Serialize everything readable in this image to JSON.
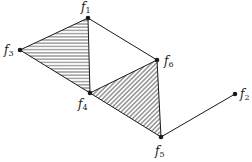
{
  "diagram": {
    "title": "",
    "nodes": [
      {
        "id": "f1",
        "label": "f",
        "sub": "1",
        "x": 88,
        "y": 18,
        "lx": 81,
        "ly": 11
      },
      {
        "id": "f2",
        "label": "f",
        "sub": "2",
        "x": 235,
        "y": 94,
        "lx": 240,
        "ly": 98
      },
      {
        "id": "f3",
        "label": "f",
        "sub": "3",
        "x": 20,
        "y": 50,
        "lx": 4,
        "ly": 54
      },
      {
        "id": "f4",
        "label": "f",
        "sub": "4",
        "x": 90,
        "y": 93,
        "lx": 78,
        "ly": 108
      },
      {
        "id": "f5",
        "label": "f",
        "sub": "5",
        "x": 161,
        "y": 137,
        "lx": 155,
        "ly": 155
      },
      {
        "id": "f6",
        "label": "f",
        "sub": "6",
        "x": 157,
        "y": 60,
        "lx": 164,
        "ly": 65
      }
    ],
    "edges": [
      [
        "f1",
        "f3"
      ],
      [
        "f1",
        "f4"
      ],
      [
        "f3",
        "f4"
      ],
      [
        "f1",
        "f6"
      ],
      [
        "f4",
        "f6"
      ],
      [
        "f4",
        "f5"
      ],
      [
        "f6",
        "f5"
      ],
      [
        "f5",
        "f2"
      ]
    ],
    "faces": [
      {
        "id": "face-f1-f3-f4",
        "vertices": [
          "f1",
          "f3",
          "f4"
        ],
        "hatch": "horizontal"
      },
      {
        "id": "face-f4-f6-f5",
        "vertices": [
          "f4",
          "f6",
          "f5"
        ],
        "hatch": "diagonal"
      }
    ],
    "colors": {
      "stroke": "#1a1a1a",
      "background": "#ffffff"
    }
  }
}
